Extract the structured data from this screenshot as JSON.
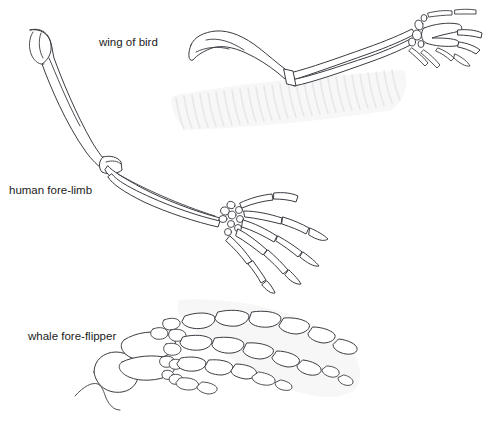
{
  "figure": {
    "background_color": "#ffffff",
    "bone_outline_color": "#3b3b42",
    "bone_fill_color": "#ffffff",
    "ghost_color": "#f0f0f2",
    "text_color": "#1c1c1c",
    "width": 488,
    "height": 427
  },
  "labels": {
    "bird": "wing of bird",
    "human": "human fore-limb",
    "whale": "whale fore-flipper"
  },
  "label_positions": {
    "bird": {
      "x": 99,
      "y": 46
    },
    "human": {
      "x": 9,
      "y": 194
    },
    "whale": {
      "x": 28,
      "y": 340
    }
  },
  "specimens": [
    {
      "id": "bird-wing",
      "label": "wing of bird",
      "parts": [
        "humerus",
        "radius",
        "ulna",
        "carpals",
        "digits"
      ],
      "digit_count": 3,
      "ghost_feature": "feathers"
    },
    {
      "id": "human-forelimb",
      "label": "human fore-limb",
      "parts": [
        "humerus",
        "radius",
        "ulna",
        "carpals",
        "metacarpals",
        "phalanges"
      ],
      "digit_count": 5,
      "ghost_feature": "none"
    },
    {
      "id": "whale-foreflipper",
      "label": "whale fore-flipper",
      "parts": [
        "humerus",
        "radius",
        "ulna",
        "carpals",
        "metacarpals",
        "phalanges"
      ],
      "digit_count": 4,
      "ghost_feature": "flipper-outline"
    }
  ]
}
